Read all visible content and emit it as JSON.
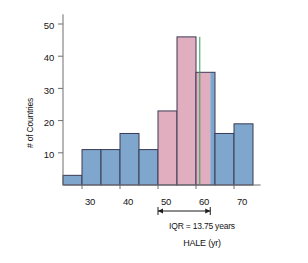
{
  "chart_data": {
    "type": "bar",
    "title": "",
    "subtitle": "",
    "xlabel": "HALE (yr)",
    "ylabel": "# of Countries",
    "xlim": [
      24,
      76
    ],
    "ylim": [
      0,
      53
    ],
    "grid": false,
    "legend": "none",
    "bin_width": 5,
    "categories": [
      "25-30",
      "30-35",
      "35-40",
      "40-45",
      "45-50",
      "50-55",
      "55-60",
      "60-65",
      "65-70",
      "70-75"
    ],
    "bin_starts": [
      25,
      30,
      35,
      40,
      45,
      50,
      55,
      60,
      65,
      70
    ],
    "values": [
      3,
      11,
      11,
      16,
      11,
      23,
      46,
      35,
      16,
      19
    ],
    "xticks": [
      30,
      40,
      50,
      60,
      70
    ],
    "xtick_labels": [
      "30",
      "40",
      "50",
      "60",
      "70"
    ],
    "yticks": [
      10,
      20,
      30,
      40,
      50
    ],
    "ytick_labels": [
      "10",
      "20",
      "30",
      "40",
      "50"
    ],
    "bar_color": "#7fa6cd",
    "bar_highlight_color": "#e0aebe",
    "bar_edge_color": "#3b3b55",
    "median_line_color": "#2f9e55",
    "median_value": 61,
    "iqr_range": [
      50,
      63.75
    ],
    "annotations": [
      {
        "name": "iqr-bracket",
        "label": "IQR = 13.75 years",
        "from": 50,
        "to": 63.75
      }
    ]
  },
  "axes": {
    "ylabel": "# of Countries",
    "xlabel": "HALE (yr)",
    "ytick_labels": [
      "50",
      "40",
      "30",
      "20",
      "10"
    ],
    "xtick_labels": [
      "30",
      "40",
      "50",
      "60",
      "70"
    ]
  },
  "annotation": {
    "iqr_text": "IQR = 13.75 years"
  }
}
